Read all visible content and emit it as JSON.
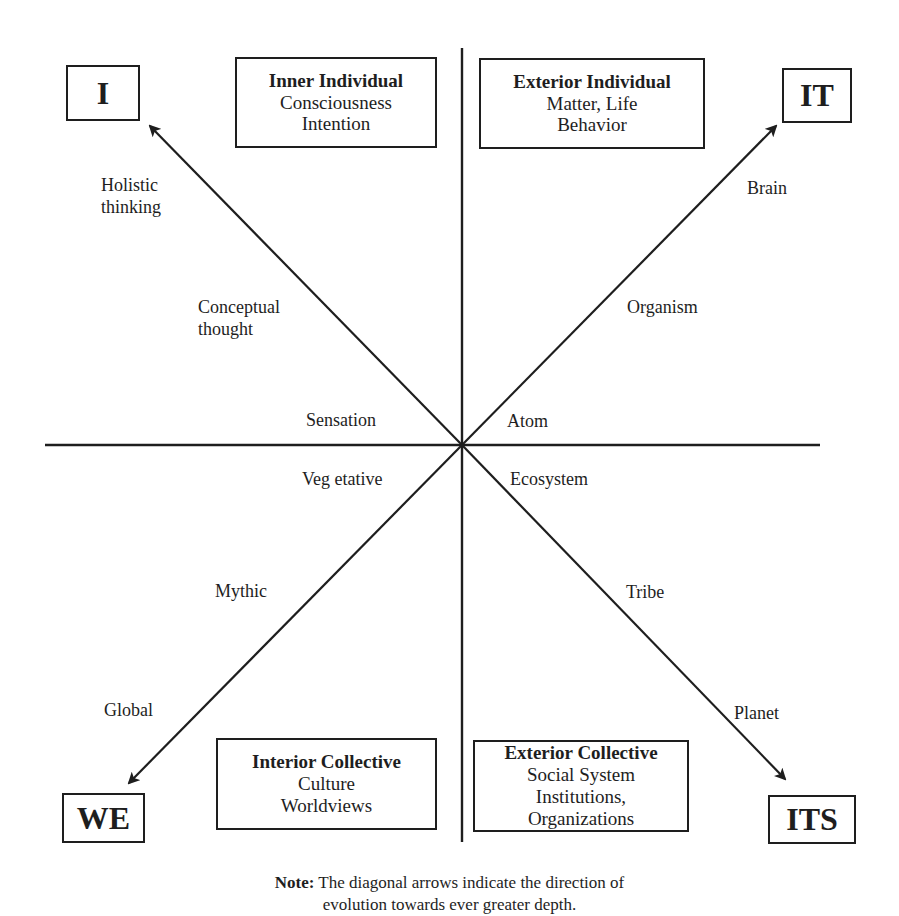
{
  "diagram": {
    "corners": {
      "upper_left": "I",
      "upper_right": "IT",
      "lower_left": "WE",
      "lower_right": "ITS"
    },
    "quadrants": {
      "upper_left": {
        "title": "Inner Individual",
        "lines": [
          "Consciousness",
          "Intention"
        ]
      },
      "upper_right": {
        "title": "Exterior Individual",
        "lines": [
          "Matter, Life",
          "Behavior"
        ]
      },
      "lower_left": {
        "title": "Interior Collective",
        "lines": [
          "Culture",
          "Worldviews"
        ]
      },
      "lower_right": {
        "title": "Exterior Collective",
        "lines": [
          "Social System",
          "Institutions,",
          "Organizations"
        ]
      }
    },
    "arrow_labels": {
      "upper_left": [
        "Sensation",
        "Conceptual thought",
        "Holistic thinking"
      ],
      "upper_right": [
        "Atom",
        "Organism",
        "Brain"
      ],
      "lower_left": [
        "Veg etative",
        "Mythic",
        "Global"
      ],
      "lower_right": [
        "Ecosystem",
        "Tribe",
        "Planet"
      ]
    },
    "note": {
      "label": "Note:",
      "text": "The diagonal arrows indicate the direction of",
      "text2": "evolution towards ever greater depth."
    },
    "colors": {
      "ink": "#1e1e1e",
      "background": "#ffffff"
    }
  }
}
